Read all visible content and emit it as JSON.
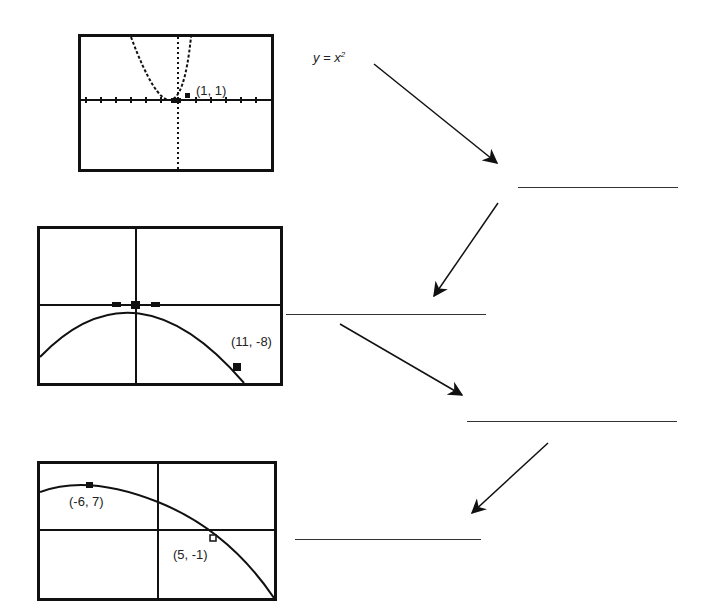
{
  "equation": {
    "lhs": "y = x",
    "exponent": "2"
  },
  "graphs": [
    {
      "id": "graph-1",
      "point_label": "(1, 1)"
    },
    {
      "id": "graph-2",
      "point_label": "(11, -8)"
    },
    {
      "id": "graph-3",
      "point_labels": [
        "(-6, 7)",
        "(5, -1)"
      ]
    }
  ],
  "answer_blanks": [
    {
      "id": "blank-1",
      "value": ""
    },
    {
      "id": "blank-2",
      "value": ""
    },
    {
      "id": "blank-3",
      "value": ""
    },
    {
      "id": "blank-4",
      "value": ""
    }
  ],
  "colors": {
    "ink": "#111111",
    "background": "#ffffff"
  }
}
